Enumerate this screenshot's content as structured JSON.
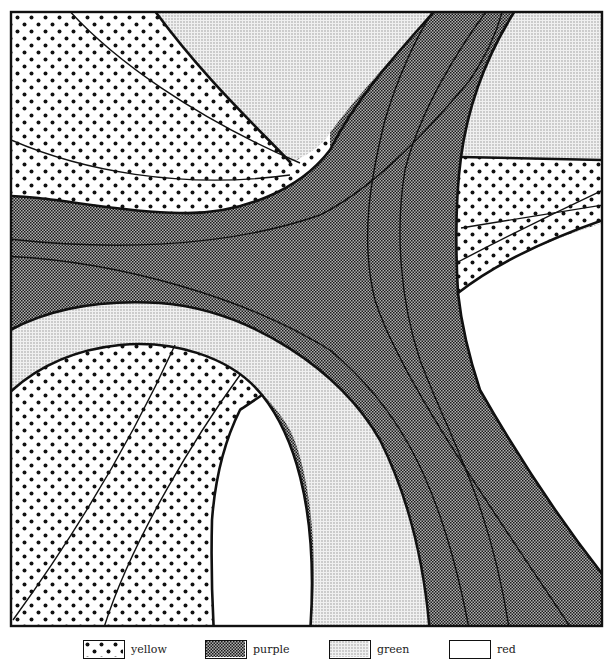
{
  "figure": {
    "type": "geologic-outcrop-map",
    "units": [
      {
        "id": "yellow",
        "pattern": "large-dots",
        "fill": "#ffffff",
        "dot": "#111111"
      },
      {
        "id": "purple",
        "pattern": "dense-checker",
        "fill": "#8c8c8c",
        "dot": "#1a1a1a"
      },
      {
        "id": "green",
        "pattern": "fine-stipple",
        "fill": "#e4e4e4",
        "dot": "#9a9a9a"
      },
      {
        "id": "red",
        "pattern": "blank",
        "fill": "#ffffff",
        "dot": ""
      }
    ]
  },
  "legend": {
    "items": [
      {
        "key": "yellow",
        "label": "yellow"
      },
      {
        "key": "purple",
        "label": "purple"
      },
      {
        "key": "green",
        "label": "green"
      },
      {
        "key": "red",
        "label": "red"
      }
    ]
  }
}
